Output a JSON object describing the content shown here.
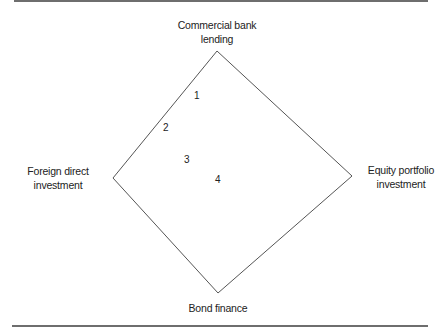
{
  "diagram": {
    "type": "diamond",
    "vertices": {
      "top": {
        "label_line1": "Commercial bank",
        "label_line2": "lending"
      },
      "left": {
        "label_line1": "Foreign direct",
        "label_line2": "investment"
      },
      "right": {
        "label_line1": "Equity portfolio",
        "label_line2": "investment"
      },
      "bottom": {
        "label_line1": "Bond finance"
      }
    },
    "points": [
      {
        "label": "1"
      },
      {
        "label": "2"
      },
      {
        "label": "3"
      },
      {
        "label": "4"
      }
    ],
    "colors": {
      "line": "#555555",
      "text": "#222222",
      "rule": "#6e6e6e"
    }
  }
}
